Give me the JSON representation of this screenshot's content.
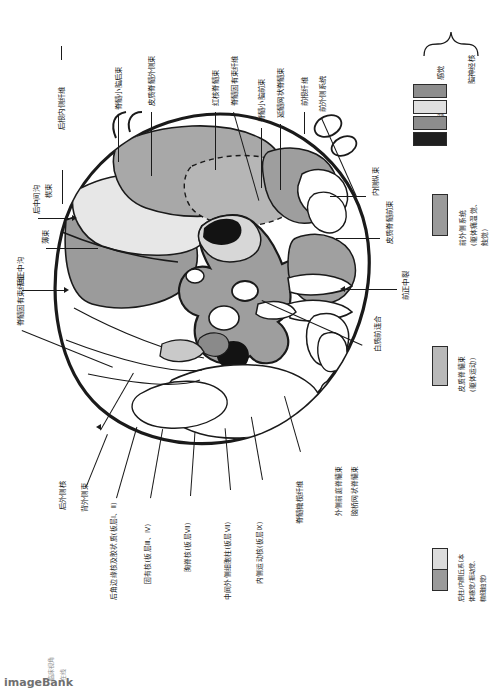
{
  "figure": {
    "title_semantic": "spinal-cord-cross-section-labeled",
    "orientation_note": "90-degree rotated anatomical plate"
  },
  "colors": {
    "outline": "#1a1a1a",
    "white_matter": "#ffffff",
    "gray_matter_mid": "#a6a6a6",
    "gray_matter_dark": "#8f8f8f",
    "tract_light": "#d8d8d8",
    "tract_pale": "#e8e8e8",
    "nucleus_black": "#111111",
    "leader": "#1a1a1a"
  },
  "labels_top": [
    {
      "id": "posterior-root-medial-fibers",
      "text": "后根内侧纤维"
    },
    {
      "id": "posterior-spinocerebellar-tract",
      "text": "脊髓小脑后束"
    },
    {
      "id": "lateral-corticospinal-tract",
      "text": "皮质脊髓外侧束"
    },
    {
      "id": "rubrospinal-tract",
      "text": "红核脊髓束"
    },
    {
      "id": "spinal-interfascicular-fibers",
      "text": "脊髓固有束纤维"
    },
    {
      "id": "anterior-spinocerebellar-tract",
      "text": "脊髓小脑前束"
    },
    {
      "id": "medullary-reticulospinal-tract",
      "text": "延髓网状脊髓束"
    },
    {
      "id": "anterior-root-fibers",
      "text": "前根纤维"
    },
    {
      "id": "anterolateral-system",
      "text": "前外侧系统"
    }
  ],
  "labels_left": [
    {
      "id": "cuneate-fasciculus",
      "text": "楔束"
    },
    {
      "id": "posterior-intermediate-sulcus",
      "text": "后中间沟"
    },
    {
      "id": "gracile-fasciculus",
      "text": "薄束"
    },
    {
      "id": "posterior-median-sulcus",
      "text": "后正中沟"
    },
    {
      "id": "spinal-proprius-fibers",
      "text": "脊髓固有束纤维"
    }
  ],
  "labels_right": [
    {
      "id": "medial-longitudinal-fasciculus",
      "text": "内侧纵束"
    },
    {
      "id": "anterior-corticospinal-tract",
      "text": "皮质脊髓前束"
    },
    {
      "id": "anterior-median-fissure",
      "text": "前正中裂"
    },
    {
      "id": "anterior-white-commissure",
      "text": "白质前连合"
    }
  ],
  "labels_bottom": [
    {
      "id": "posterolateral-nucleus",
      "text": "后外侧核"
    },
    {
      "id": "dorsolateral-fasciculus",
      "text": "背外侧束"
    },
    {
      "id": "marginal-nucleus-substantia-gelatinosa",
      "text": "后角边缘核及胶状质(板层Ⅰ、Ⅱ)"
    },
    {
      "id": "proper-nucleus",
      "text": "固有核(板层Ⅲ、Ⅳ)"
    },
    {
      "id": "thoracic-nucleus",
      "text": "胸脊核(板层Ⅶ)"
    },
    {
      "id": "intermediolateral-cell-column",
      "text": "中间外侧细胞柱(板层Ⅶ)"
    },
    {
      "id": "medial-motor-nucleus",
      "text": "内侧运动核(板层Ⅸ)"
    },
    {
      "id": "spinal-olivary-fibers",
      "text": "脊髓橄榄纤维"
    },
    {
      "id": "lateral-vestibulospinal-tract",
      "text": "外侧前庭脊髓束"
    },
    {
      "id": "pontine-reticulospinal-tract",
      "text": "脑桥网状脊髓束"
    }
  ],
  "legend_cranial": {
    "group_label": "脑神经核",
    "items": [
      {
        "id": "sensory",
        "text": "感觉",
        "swatches": [
          "#8d8d8d",
          "#e0e0e0"
        ]
      },
      {
        "id": "motor",
        "text": "运动",
        "swatches": [
          "#8d8d8d",
          "#1f1f1f"
        ]
      }
    ]
  },
  "legend_tracts": [
    {
      "id": "anterolateral-system-legend",
      "lines": [
        "前外侧系统",
        "(躯体痛温觉、",
        "触觉)"
      ],
      "swatch": "#9a9a9a"
    },
    {
      "id": "corticospinal-tract-legend",
      "lines": [
        "皮质脊髓束",
        "(躯体运动)"
      ],
      "swatch": "#b9b9b9"
    },
    {
      "id": "posterior-column-medial-lemniscus-legend",
      "lines": [
        "后柱/内侧丘系(本",
        "体感觉/振动觉、",
        "精细触觉)"
      ],
      "swatch_top": "#dcdcdc",
      "swatch_bottom": "#9a9a9a"
    }
  ],
  "watermark": {
    "line1": "临床视角",
    "line2": "在线",
    "brand": "imageBank"
  }
}
